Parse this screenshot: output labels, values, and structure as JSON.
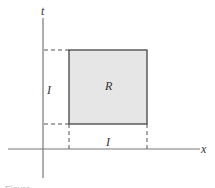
{
  "diagram": {
    "axes": {
      "x_label": "x",
      "y_label": "t"
    },
    "region": {
      "label": "R",
      "fill": "#e6e6e6",
      "stroke": "#444444"
    },
    "interval_labels": {
      "horizontal": "I",
      "vertical": "I"
    },
    "caption": "Figure"
  }
}
